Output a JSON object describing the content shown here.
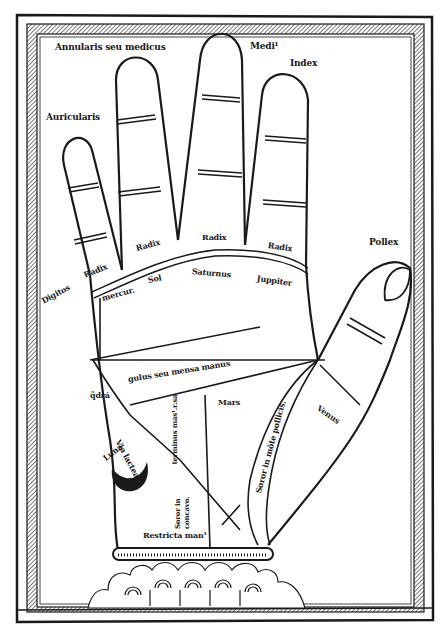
{
  "figure": {
    "colors": {
      "ink": "#1a1a1a",
      "paper": "#ffffff"
    }
  },
  "labels": {
    "ring_finger": "Annularis seu medicus",
    "middle_finger": "Medi¹",
    "index_finger": "Index",
    "little_finger": "Auricularis",
    "thumb": "Pollex",
    "digitos": "Digitos",
    "radix_little": "Radix",
    "radix_ring": "Radix",
    "radix_middle": "Radix",
    "radix_index": "Radix",
    "mercury": "mercur.",
    "sol": "Sol",
    "saturn": "Saturnus",
    "jupiter": "Juppiter",
    "quadrangle": "gulus seu mensa manus",
    "qdra": "q̃drá",
    "mars": "Mars",
    "venus": "Venus",
    "via_lactea": "Via lactea",
    "luna": "Luna",
    "terminus": "terminus mas¹.r.sa",
    "soror_pollicis": "Soror in mõte pollicis.",
    "soror_concavo": "Soror in concavo.",
    "restricta": "Restricta man¹"
  }
}
